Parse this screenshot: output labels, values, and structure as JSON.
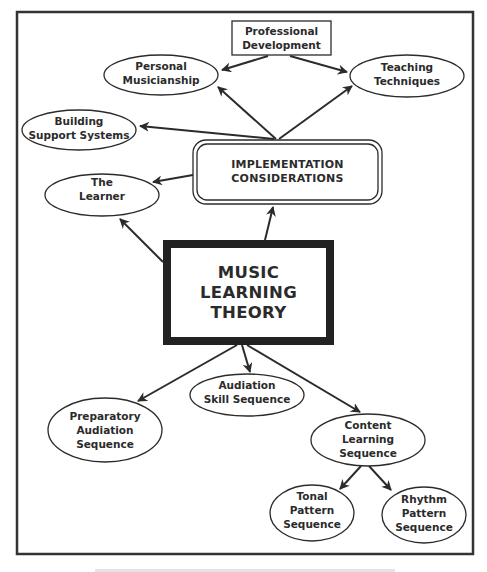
{
  "diagram": {
    "title_lines": [
      "MUSIC",
      "LEARNING",
      "THEORY"
    ],
    "colors": {
      "ink": "#2b2b2b",
      "frame": "#333333",
      "background": "#ffffff"
    },
    "nodes": {
      "central": {
        "shape": "thick-rectangle",
        "lines": [
          "MUSIC",
          "LEARNING",
          "THEORY"
        ]
      },
      "implementation": {
        "shape": "double-rounded-rectangle",
        "lines": [
          "IMPLEMENTATION",
          "CONSIDERATIONS"
        ]
      },
      "professional": {
        "shape": "rectangle",
        "lines": [
          "Professional",
          "Development"
        ]
      },
      "musicianship": {
        "shape": "ellipse",
        "lines": [
          "Personal",
          "Musicianship"
        ]
      },
      "teaching": {
        "shape": "ellipse",
        "lines": [
          "Teaching",
          "Techniques"
        ]
      },
      "support": {
        "shape": "ellipse",
        "lines": [
          "Building",
          "Support Systems"
        ]
      },
      "learner": {
        "shape": "ellipse",
        "lines": [
          "The",
          "Learner"
        ]
      },
      "preparatory": {
        "shape": "ellipse",
        "lines": [
          "Preparatory",
          "Audiation",
          "Sequence"
        ]
      },
      "skill": {
        "shape": "ellipse",
        "lines": [
          "Audiation",
          "Skill Sequence"
        ]
      },
      "content": {
        "shape": "ellipse",
        "lines": [
          "Content",
          "Learning",
          "Sequence"
        ]
      },
      "tonal": {
        "shape": "ellipse",
        "lines": [
          "Tonal",
          "Pattern",
          "Sequence"
        ]
      },
      "rhythm": {
        "shape": "ellipse",
        "lines": [
          "Rhythm",
          "Pattern",
          "Sequence"
        ]
      }
    },
    "edges": [
      {
        "from": "professional",
        "to": "musicianship"
      },
      {
        "from": "professional",
        "to": "teaching"
      },
      {
        "from": "implementation",
        "to": "musicianship"
      },
      {
        "from": "implementation",
        "to": "teaching"
      },
      {
        "from": "implementation",
        "to": "support"
      },
      {
        "from": "implementation",
        "to": "learner"
      },
      {
        "from": "central",
        "to": "implementation"
      },
      {
        "from": "central",
        "to": "learner"
      },
      {
        "from": "central",
        "to": "preparatory"
      },
      {
        "from": "central",
        "to": "skill"
      },
      {
        "from": "central",
        "to": "content"
      },
      {
        "from": "content",
        "to": "tonal"
      },
      {
        "from": "content",
        "to": "rhythm"
      }
    ],
    "caption": ""
  }
}
